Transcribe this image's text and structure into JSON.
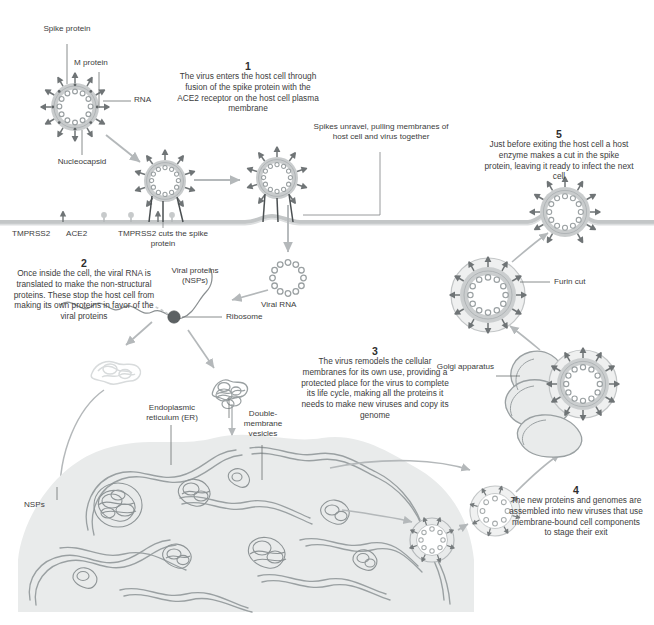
{
  "diagram": {
    "colors": {
      "background": "#ffffff",
      "text": "#3c3c3c",
      "membrane": "#b9bcbd",
      "virus_envelope": "#c9cccd",
      "virus_inner": "#aeb2b4",
      "spike_dark": "#6f7476",
      "organelle_fill": "#e4e6e6",
      "organelle_stroke": "#9aa0a2",
      "arrow": "#b4b8ba",
      "nsp_light": "#d6d9da"
    }
  },
  "steps": [
    {
      "number": "1",
      "text": "The virus enters the host\ncell through fusion of the\nspike protein with the\nACE2 receptor on the host\ncell plasma membrane"
    },
    {
      "number": "2",
      "text": "Once inside the cell, the\nviral RNA is translated to\nmake the non-structural\nproteins. These stop the\nhost cell from making its\nown proteins in favor of\nthe viral proteins"
    },
    {
      "number": "3",
      "text": "The virus remodels the\ncellular membranes for its\nown use, providing a\nprotected place for the virus\nto complete its life cycle,\nmaking all the proteins it\nneeds to make new viruses\nand copy its genome"
    },
    {
      "number": "4",
      "text": "The new proteins and\ngenomes are assembled\ninto new viruses that\nuse membrane-bound\ncell components to\nstage their exit"
    },
    {
      "number": "5",
      "text": "Just before exiting the\nhost cell a host enzyme\nmakes a cut in the spike\nprotein, leaving it ready\nto infect the next cell"
    }
  ],
  "labels": {
    "spike_protein": "Spike\nprotein",
    "m_protein": "M protein",
    "rna": "RNA",
    "nucleocapsid": "Nucleocapsid",
    "tmprss2": "TMPRSS2",
    "ace2": "ACE2",
    "tmprss2_cuts": "TMPRSS2 cuts the\nspike protein",
    "spikes_unravel": "Spikes unravel, pulling\nmembranes of host cell\nand virus together",
    "viral_proteins": "Viral\nproteins\n(NSPs)",
    "viral_rna": "Viral RNA",
    "ribosome": "Ribosome",
    "endoplasmic_reticulum": "Endoplasmic\nreticulum (ER)",
    "double_membrane_vesicles": "Double-\nmembrane\nvesicles",
    "nsps": "NSPs",
    "furin_cut": "Furin cut",
    "golgi_apparatus": "Golgi\napparatus"
  }
}
